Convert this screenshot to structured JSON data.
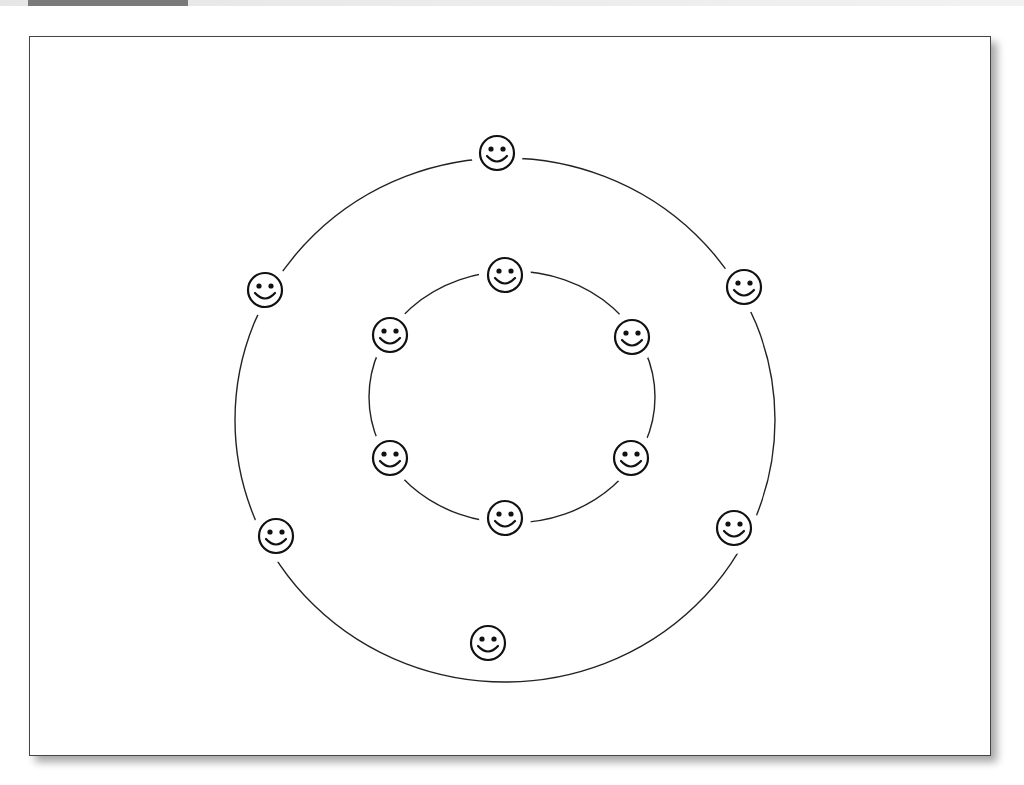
{
  "figure": {
    "label_band_color": "#7a7a7a",
    "frame_border_color": "#444444",
    "background": "#ffffff"
  },
  "diagram": {
    "rings": [
      {
        "name": "outer-ring",
        "cx": 505,
        "cy": 420,
        "rx": 270,
        "ry": 262,
        "members": [
          {
            "name": "outer-top",
            "x": 497,
            "y": 153
          },
          {
            "name": "outer-upper-right",
            "x": 744,
            "y": 287
          },
          {
            "name": "outer-lower-right",
            "x": 734,
            "y": 528
          },
          {
            "name": "outer-bottom",
            "x": 488,
            "y": 643
          },
          {
            "name": "outer-lower-left",
            "x": 276,
            "y": 536
          },
          {
            "name": "outer-upper-left",
            "x": 265,
            "y": 290
          }
        ]
      },
      {
        "name": "inner-ring",
        "cx": 512,
        "cy": 397,
        "rx": 143,
        "ry": 126,
        "members": [
          {
            "name": "inner-top",
            "x": 505,
            "y": 275
          },
          {
            "name": "inner-upper-right",
            "x": 632,
            "y": 337
          },
          {
            "name": "inner-lower-right",
            "x": 631,
            "y": 458
          },
          {
            "name": "inner-bottom",
            "x": 505,
            "y": 518
          },
          {
            "name": "inner-lower-left",
            "x": 390,
            "y": 458
          },
          {
            "name": "inner-upper-left",
            "x": 390,
            "y": 335
          }
        ]
      }
    ],
    "icon": "smiley-face-icon",
    "face_radius": 17,
    "line_color": "#222222"
  }
}
